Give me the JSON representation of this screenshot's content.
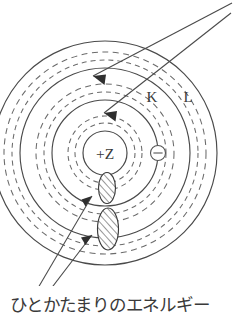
{
  "figure": {
    "caption": "ひとかたまりのエネルギー",
    "nucleus": {
      "label": "+Z",
      "cx": 105,
      "cy": 153,
      "r": 22
    },
    "shell_labels": [
      {
        "text": "K",
        "x": 152,
        "y": 102
      },
      {
        "text": "L",
        "x": 188,
        "y": 102
      }
    ],
    "electron": {
      "symbol": "−",
      "cx": 158,
      "cy": 153,
      "r": 7.5
    },
    "shells": [
      {
        "name": "nucleus-boundary",
        "r": 22,
        "style": "solid"
      },
      {
        "name": "k-shell-inner-dashed-a",
        "r": 30,
        "style": "dashed"
      },
      {
        "name": "k-shell-inner-dashed-b",
        "r": 37,
        "style": "dashed"
      },
      {
        "name": "k-shell",
        "r": 53,
        "style": "solid"
      },
      {
        "name": "k-l-dashed-a",
        "r": 61,
        "style": "dashed"
      },
      {
        "name": "k-l-dashed-b",
        "r": 69,
        "style": "dashed"
      },
      {
        "name": "l-shell",
        "r": 85,
        "style": "solid"
      },
      {
        "name": "l-outer-dashed-a",
        "r": 93,
        "style": "dashed"
      },
      {
        "name": "l-outer-dashed-b",
        "r": 101,
        "style": "dashed"
      },
      {
        "name": "outer-shell",
        "r": 112,
        "style": "solid"
      }
    ],
    "energy_packets": [
      {
        "name": "upper-packet",
        "cx": 107,
        "cy": 188,
        "rx": 8.5,
        "ry": 15.5
      },
      {
        "name": "lower-packet",
        "cx": 108,
        "cy": 229,
        "rx": 10.5,
        "ry": 21
      }
    ],
    "incident_rays": [
      {
        "name": "upper-ray",
        "x1": 232,
        "y1": 3,
        "x2": 93,
        "y2": 76
      },
      {
        "name": "lower-ray",
        "x1": 231,
        "y1": 13,
        "x2": 104,
        "y2": 113
      }
    ],
    "pointer_lines": [
      {
        "name": "upper-pointer",
        "x1": 38,
        "y1": 288,
        "x2": 92,
        "y2": 196
      },
      {
        "name": "lower-pointer",
        "x1": 50,
        "y1": 290,
        "x2": 92,
        "y2": 235
      }
    ],
    "colors": {
      "stroke": "#4a4a4a",
      "dashed_stroke": "#6b6b6b",
      "text": "#3a3a3a",
      "background": "#ffffff"
    }
  }
}
